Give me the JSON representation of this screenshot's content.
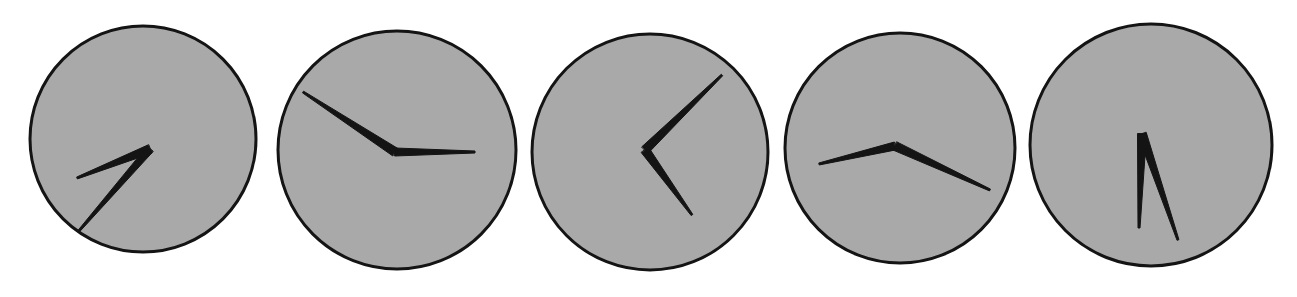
{
  "figure": {
    "type": "clock-face-panel-row",
    "panel_count": 5,
    "background_color": "#ffffff",
    "dial_fill_color": "#a9a9a9",
    "dial_stroke_color": "#141414",
    "hand_color": "#141414",
    "canvas": {
      "width": 1297,
      "height": 297
    }
  },
  "clocks": [
    {
      "id": "clock-1",
      "label": "clock-face-1",
      "center": {
        "x": 143,
        "y": 139
      },
      "radius": 113,
      "rim_width": 3,
      "pivot": {
        "x": 150,
        "y": 149
      },
      "hands": [
        {
          "name": "hour-hand",
          "tip": {
            "x": 77,
            "y": 178
          },
          "base_width": 9,
          "tip_width": 2,
          "angle_deg": 249,
          "length": 82
        },
        {
          "name": "minute-hand",
          "tip": {
            "x": 78,
            "y": 232
          },
          "base_width": 8,
          "tip_width": 2,
          "angle_deg": 228,
          "length": 115
        }
      ]
    },
    {
      "id": "clock-2",
      "label": "clock-face-2",
      "center": {
        "x": 397,
        "y": 150
      },
      "radius": 119,
      "rim_width": 3,
      "pivot": {
        "x": 395,
        "y": 152
      },
      "hands": [
        {
          "name": "hour-hand",
          "tip": {
            "x": 475,
            "y": 152
          },
          "base_width": 8,
          "tip_width": 2,
          "angle_deg": 0,
          "length": 80
        },
        {
          "name": "minute-hand",
          "tip": {
            "x": 303,
            "y": 92
          },
          "base_width": 9,
          "tip_width": 2,
          "angle_deg": 147,
          "length": 110
        }
      ]
    },
    {
      "id": "clock-3",
      "label": "clock-face-3",
      "center": {
        "x": 650,
        "y": 152
      },
      "radius": 118,
      "rim_width": 3,
      "pivot": {
        "x": 645,
        "y": 150
      },
      "hands": [
        {
          "name": "hour-hand",
          "tip": {
            "x": 692,
            "y": 215
          },
          "base_width": 9,
          "tip_width": 2,
          "angle_deg": 304,
          "length": 78
        },
        {
          "name": "minute-hand",
          "tip": {
            "x": 722,
            "y": 75
          },
          "base_width": 9,
          "tip_width": 2,
          "angle_deg": 46,
          "length": 108
        }
      ]
    },
    {
      "id": "clock-4",
      "label": "clock-face-4",
      "center": {
        "x": 900,
        "y": 148
      },
      "radius": 115,
      "rim_width": 3,
      "pivot": {
        "x": 895,
        "y": 146
      },
      "hands": [
        {
          "name": "hour-hand",
          "tip": {
            "x": 819,
            "y": 164
          },
          "base_width": 8,
          "tip_width": 2,
          "angle_deg": 191,
          "length": 78
        },
        {
          "name": "minute-hand",
          "tip": {
            "x": 990,
            "y": 190
          },
          "base_width": 9,
          "tip_width": 2,
          "angle_deg": 334,
          "length": 105
        }
      ]
    },
    {
      "id": "clock-5",
      "label": "clock-face-5",
      "center": {
        "x": 1151,
        "y": 145
      },
      "radius": 121,
      "rim_width": 3,
      "pivot": {
        "x": 1142,
        "y": 134
      },
      "hands": [
        {
          "name": "hour-hand",
          "tip": {
            "x": 1139,
            "y": 228
          },
          "base_width": 9,
          "tip_width": 2,
          "angle_deg": 268,
          "length": 94
        },
        {
          "name": "minute-hand",
          "tip": {
            "x": 1178,
            "y": 240
          },
          "base_width": 9,
          "tip_width": 2,
          "angle_deg": 289,
          "length": 113
        }
      ]
    }
  ]
}
